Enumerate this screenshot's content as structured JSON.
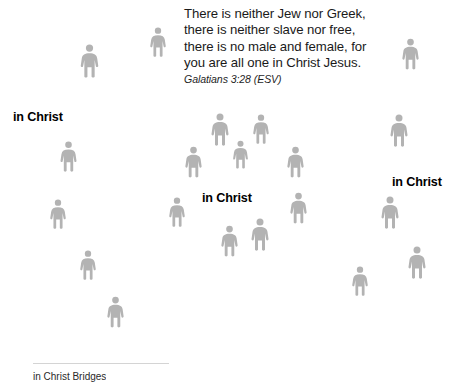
{
  "slide": {
    "width": 460,
    "height": 383,
    "background_color": "#ffffff"
  },
  "quote": {
    "text": "There is neither Jew nor Greek,\nthere is neither slave nor free,\nthere is no male and female, for\nyou are all one in Christ Jesus.",
    "attribution": "Galatians 3:28 (ESV)",
    "text_color": "#1a1a1a"
  },
  "labels": [
    {
      "text": "in Christ",
      "x": 13,
      "y": 110
    },
    {
      "text": "in Christ",
      "x": 202,
      "y": 191
    },
    {
      "text": "in Christ",
      "x": 392,
      "y": 175
    }
  ],
  "figures": {
    "color": "#b3b3b3",
    "icon": "person-pictogram",
    "items": [
      {
        "x": 78,
        "y": 44,
        "w": 23,
        "h": 34
      },
      {
        "x": 148,
        "y": 27,
        "w": 20,
        "h": 30
      },
      {
        "x": 400,
        "y": 38,
        "w": 21,
        "h": 32
      },
      {
        "x": 209,
        "y": 113,
        "w": 22,
        "h": 33
      },
      {
        "x": 251,
        "y": 114,
        "w": 20,
        "h": 30
      },
      {
        "x": 388,
        "y": 114,
        "w": 22,
        "h": 33
      },
      {
        "x": 58,
        "y": 141,
        "w": 21,
        "h": 31
      },
      {
        "x": 183,
        "y": 146,
        "w": 21,
        "h": 32
      },
      {
        "x": 231,
        "y": 140,
        "w": 19,
        "h": 29
      },
      {
        "x": 285,
        "y": 146,
        "w": 21,
        "h": 32
      },
      {
        "x": 48,
        "y": 199,
        "w": 20,
        "h": 30
      },
      {
        "x": 167,
        "y": 197,
        "w": 20,
        "h": 30
      },
      {
        "x": 288,
        "y": 192,
        "w": 21,
        "h": 32
      },
      {
        "x": 379,
        "y": 196,
        "w": 22,
        "h": 33
      },
      {
        "x": 219,
        "y": 225,
        "w": 21,
        "h": 32
      },
      {
        "x": 249,
        "y": 218,
        "w": 22,
        "h": 33
      },
      {
        "x": 406,
        "y": 246,
        "w": 22,
        "h": 33
      },
      {
        "x": 78,
        "y": 250,
        "w": 20,
        "h": 30
      },
      {
        "x": 350,
        "y": 266,
        "w": 20,
        "h": 30
      },
      {
        "x": 105,
        "y": 296,
        "w": 21,
        "h": 32
      }
    ]
  },
  "footer": {
    "note": "in Christ Bridges"
  }
}
